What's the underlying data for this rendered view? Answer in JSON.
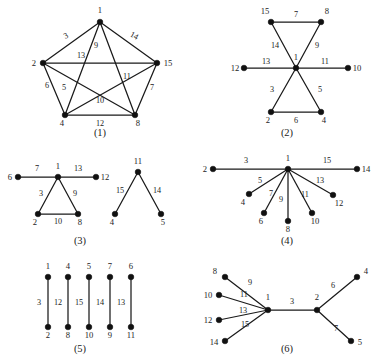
{
  "figure": {
    "background_color": "#ffffff",
    "ink_color": "#1a1a1a",
    "width": 379,
    "height": 363
  },
  "chart_data": {
    "type": "diagram",
    "title": "",
    "subtitle": "",
    "xlabel": "",
    "ylabel": "",
    "panel_count": 6,
    "panels": [
      {
        "caption": "(1)",
        "caption_x": 100,
        "caption_y": 136,
        "vertex_count": 5,
        "edge_count": 10,
        "vertices": [
          {
            "id": "1",
            "x": 100,
            "y": 22,
            "lx": 100,
            "ly": 13,
            "anchor": "middle"
          },
          {
            "id": "2",
            "x": 43,
            "y": 63,
            "lx": 34,
            "ly": 66,
            "anchor": "middle"
          },
          {
            "id": "15",
            "x": 157,
            "y": 63,
            "lx": 168,
            "ly": 66,
            "anchor": "middle"
          },
          {
            "id": "4",
            "x": 65,
            "y": 115,
            "lx": 62,
            "ly": 126,
            "anchor": "middle"
          },
          {
            "id": "8",
            "x": 135,
            "y": 115,
            "lx": 138,
            "ly": 126,
            "anchor": "middle"
          }
        ],
        "edges": [
          {
            "label": "3",
            "from": "1",
            "to": "2",
            "lx": 67,
            "ly": 38,
            "rot": -28
          },
          {
            "label": "14",
            "from": "1",
            "to": "15",
            "lx": 133,
            "ly": 38,
            "rot": 28
          },
          {
            "label": "13",
            "from": "2",
            "to": "15",
            "lx": 81,
            "ly": 58,
            "rot": 0
          },
          {
            "label": "9",
            "from": "1",
            "to": "4",
            "lx": 96,
            "ly": 48,
            "rot": 0
          },
          {
            "label": "11",
            "from": "1",
            "to": "8",
            "lx": 127,
            "ly": 79,
            "rot": 0
          },
          {
            "label": "6",
            "from": "2",
            "to": "4",
            "lx": 47,
            "ly": 88,
            "rot": 0
          },
          {
            "label": "5",
            "from": "2",
            "to": "8",
            "lx": 64,
            "ly": 90,
            "rot": 0
          },
          {
            "label": "10",
            "from": "4",
            "to": "15",
            "lx": 100,
            "ly": 103,
            "rot": 0
          },
          {
            "label": "7",
            "from": "15",
            "to": "8",
            "lx": 152,
            "ly": 90,
            "rot": 0
          },
          {
            "label": "12",
            "from": "4",
            "to": "8",
            "lx": 100,
            "ly": 126,
            "rot": 0
          }
        ]
      },
      {
        "caption": "(2)",
        "caption_x": 287,
        "caption_y": 136,
        "vertex_count": 7,
        "edge_count": 6,
        "vertices": [
          {
            "id": "15",
            "x": 271,
            "y": 22,
            "lx": 265,
            "ly": 14,
            "anchor": "middle"
          },
          {
            "id": "8",
            "x": 321,
            "y": 22,
            "lx": 327,
            "ly": 14,
            "anchor": "middle"
          },
          {
            "id": "1",
            "x": 296,
            "y": 68,
            "lx": 296,
            "ly": 60,
            "anchor": "middle"
          },
          {
            "id": "12",
            "x": 244,
            "y": 68,
            "lx": 235,
            "ly": 71,
            "anchor": "middle"
          },
          {
            "id": "10",
            "x": 348,
            "y": 68,
            "lx": 357,
            "ly": 71,
            "anchor": "middle"
          },
          {
            "id": "2",
            "x": 271,
            "y": 112,
            "lx": 268,
            "ly": 123,
            "anchor": "middle"
          },
          {
            "id": "4",
            "x": 321,
            "y": 112,
            "lx": 324,
            "ly": 123,
            "anchor": "middle"
          }
        ],
        "edges": [
          {
            "label": "7",
            "from": "15",
            "to": "8",
            "lx": 296,
            "ly": 17,
            "rot": 0
          },
          {
            "label": "14",
            "from": "15",
            "to": "1",
            "lx": 275,
            "ly": 48,
            "rot": 0
          },
          {
            "label": "9",
            "from": "8",
            "to": "1",
            "lx": 317,
            "ly": 48,
            "rot": 0
          },
          {
            "label": "13",
            "from": "12",
            "to": "1",
            "lx": 266,
            "ly": 64,
            "rot": 0
          },
          {
            "label": "11",
            "from": "1",
            "to": "10",
            "lx": 325,
            "ly": 64,
            "rot": 0
          },
          {
            "label": "3",
            "from": "1",
            "to": "2",
            "lx": 272,
            "ly": 92,
            "rot": 0
          },
          {
            "label": "5",
            "from": "1",
            "to": "4",
            "lx": 320,
            "ly": 92,
            "rot": 0
          },
          {
            "label": "6",
            "from": "2",
            "to": "4",
            "lx": 296,
            "ly": 123,
            "rot": 0
          }
        ]
      },
      {
        "caption": "(3)",
        "caption_x": 80,
        "caption_y": 244,
        "vertex_count": 9,
        "edge_count": 7,
        "vertices": [
          {
            "id": "6",
            "x": 18,
            "y": 177,
            "lx": 10,
            "ly": 180,
            "anchor": "middle"
          },
          {
            "id": "1",
            "x": 58,
            "y": 177,
            "lx": 58,
            "ly": 169,
            "anchor": "middle"
          },
          {
            "id": "12",
            "x": 96,
            "y": 177,
            "lx": 105,
            "ly": 180,
            "anchor": "middle"
          },
          {
            "id": "2",
            "x": 38,
            "y": 214,
            "lx": 35,
            "ly": 225,
            "anchor": "middle"
          },
          {
            "id": "8",
            "x": 78,
            "y": 214,
            "lx": 80,
            "ly": 225,
            "anchor": "middle"
          },
          {
            "id": "11",
            "x": 138,
            "y": 172,
            "lx": 138,
            "ly": 164,
            "anchor": "middle"
          },
          {
            "id": "4",
            "x": 115,
            "y": 214,
            "lx": 112,
            "ly": 225,
            "anchor": "middle"
          },
          {
            "id": "5",
            "x": 161,
            "y": 214,
            "lx": 163,
            "ly": 225,
            "anchor": "middle"
          }
        ],
        "edges": [
          {
            "label": "7",
            "from": "6",
            "to": "1",
            "lx": 37,
            "ly": 171,
            "rot": 0
          },
          {
            "label": "13",
            "from": "1",
            "to": "12",
            "lx": 78,
            "ly": 171,
            "rot": 0
          },
          {
            "label": "3",
            "from": "1",
            "to": "2",
            "lx": 41,
            "ly": 196,
            "rot": 0
          },
          {
            "label": "9",
            "from": "1",
            "to": "8",
            "lx": 75,
            "ly": 196,
            "rot": 0
          },
          {
            "label": "10",
            "from": "2",
            "to": "8",
            "lx": 58,
            "ly": 224,
            "rot": 0
          },
          {
            "label": "15",
            "from": "11",
            "to": "4",
            "lx": 120,
            "ly": 193,
            "rot": 0
          },
          {
            "label": "14",
            "from": "11",
            "to": "5",
            "lx": 157,
            "ly": 193,
            "rot": 0
          }
        ]
      },
      {
        "caption": "(4)",
        "caption_x": 287,
        "caption_y": 244,
        "vertex_count": 9,
        "edge_count": 8,
        "vertices": [
          {
            "id": "1",
            "x": 288,
            "y": 169,
            "lx": 288,
            "ly": 161,
            "anchor": "middle"
          },
          {
            "id": "2",
            "x": 213,
            "y": 169,
            "lx": 205,
            "ly": 172,
            "anchor": "middle"
          },
          {
            "id": "14",
            "x": 357,
            "y": 169,
            "lx": 366,
            "ly": 172,
            "anchor": "middle"
          },
          {
            "id": "4",
            "x": 249,
            "y": 194,
            "lx": 243,
            "ly": 205,
            "anchor": "middle"
          },
          {
            "id": "6",
            "x": 264,
            "y": 213,
            "lx": 261,
            "ly": 224,
            "anchor": "middle"
          },
          {
            "id": "8",
            "x": 288,
            "y": 221,
            "lx": 288,
            "ly": 232,
            "anchor": "middle"
          },
          {
            "id": "10",
            "x": 312,
            "y": 213,
            "lx": 315,
            "ly": 224,
            "anchor": "middle"
          },
          {
            "id": "12",
            "x": 333,
            "y": 195,
            "lx": 339,
            "ly": 206,
            "anchor": "middle"
          }
        ],
        "edges": [
          {
            "label": "3",
            "from": "2",
            "to": "1",
            "lx": 246,
            "ly": 163,
            "rot": 0
          },
          {
            "label": "15",
            "from": "1",
            "to": "14",
            "lx": 327,
            "ly": 163,
            "rot": 0
          },
          {
            "label": "5",
            "from": "1",
            "to": "4",
            "lx": 260,
            "ly": 183,
            "rot": 0
          },
          {
            "label": "7",
            "from": "1",
            "to": "6",
            "lx": 271,
            "ly": 196,
            "rot": 0
          },
          {
            "label": "9",
            "from": "1",
            "to": "8",
            "lx": 281,
            "ly": 202,
            "rot": 0
          },
          {
            "label": "11",
            "from": "1",
            "to": "10",
            "lx": 305,
            "ly": 197,
            "rot": 0
          },
          {
            "label": "13",
            "from": "1",
            "to": "12",
            "lx": 320,
            "ly": 183,
            "rot": 0
          }
        ]
      },
      {
        "caption": "(5)",
        "caption_x": 80,
        "caption_y": 352,
        "vertex_count": 10,
        "edge_count": 5,
        "vertices": [
          {
            "id": "1",
            "x": 48,
            "y": 277,
            "lx": 48,
            "ly": 269,
            "anchor": "middle"
          },
          {
            "id": "4",
            "x": 68,
            "y": 277,
            "lx": 68,
            "ly": 269,
            "anchor": "middle"
          },
          {
            "id": "5",
            "x": 89,
            "y": 277,
            "lx": 89,
            "ly": 269,
            "anchor": "middle"
          },
          {
            "id": "7",
            "x": 110,
            "y": 277,
            "lx": 110,
            "ly": 269,
            "anchor": "middle"
          },
          {
            "id": "6",
            "x": 131,
            "y": 277,
            "lx": 131,
            "ly": 269,
            "anchor": "middle"
          },
          {
            "id": "2",
            "x": 48,
            "y": 327,
            "lx": 48,
            "ly": 338,
            "anchor": "middle"
          },
          {
            "id": "8",
            "x": 68,
            "y": 327,
            "lx": 68,
            "ly": 338,
            "anchor": "middle"
          },
          {
            "id": "10",
            "x": 89,
            "y": 327,
            "lx": 89,
            "ly": 338,
            "anchor": "middle"
          },
          {
            "id": "9",
            "x": 110,
            "y": 327,
            "lx": 110,
            "ly": 338,
            "anchor": "middle"
          },
          {
            "id": "11",
            "x": 131,
            "y": 327,
            "lx": 131,
            "ly": 338,
            "anchor": "middle"
          }
        ],
        "edges": [
          {
            "label": "3",
            "from": "1",
            "to": "2",
            "lx": 39,
            "ly": 305,
            "rot": 0
          },
          {
            "label": "12",
            "from": "4",
            "to": "8",
            "lx": 58,
            "ly": 305,
            "rot": 0
          },
          {
            "label": "15",
            "from": "5",
            "to": "10",
            "lx": 79,
            "ly": 305,
            "rot": 0
          },
          {
            "label": "14",
            "from": "7",
            "to": "9",
            "lx": 100,
            "ly": 305,
            "rot": 0
          },
          {
            "label": "13",
            "from": "6",
            "to": "11",
            "lx": 121,
            "ly": 305,
            "rot": 0
          }
        ]
      },
      {
        "caption": "(6)",
        "caption_x": 287,
        "caption_y": 352,
        "vertex_count": 9,
        "edge_count": 7,
        "vertices": [
          {
            "id": "1",
            "x": 268,
            "y": 310,
            "lx": 268,
            "ly": 300,
            "anchor": "middle"
          },
          {
            "id": "2",
            "x": 317,
            "y": 310,
            "lx": 317,
            "ly": 300,
            "anchor": "middle"
          },
          {
            "id": "8",
            "x": 225,
            "y": 277,
            "lx": 215,
            "ly": 274,
            "anchor": "middle"
          },
          {
            "id": "10",
            "x": 219,
            "y": 295,
            "lx": 208,
            "ly": 298,
            "anchor": "middle"
          },
          {
            "id": "12",
            "x": 219,
            "y": 320,
            "lx": 208,
            "ly": 323,
            "anchor": "middle"
          },
          {
            "id": "14",
            "x": 225,
            "y": 341,
            "lx": 214,
            "ly": 345,
            "anchor": "middle"
          },
          {
            "id": "4",
            "x": 357,
            "y": 277,
            "lx": 366,
            "ly": 274,
            "anchor": "middle"
          },
          {
            "id": "5",
            "x": 351,
            "y": 341,
            "lx": 360,
            "ly": 345,
            "anchor": "middle"
          }
        ],
        "edges": [
          {
            "label": "9",
            "from": "8",
            "to": "1",
            "lx": 250,
            "ly": 285,
            "rot": 0
          },
          {
            "label": "11",
            "from": "10",
            "to": "1",
            "lx": 244,
            "ly": 297,
            "rot": 0
          },
          {
            "label": "13",
            "from": "12",
            "to": "1",
            "lx": 243,
            "ly": 313,
            "rot": 0
          },
          {
            "label": "15",
            "from": "14",
            "to": "1",
            "lx": 245,
            "ly": 327,
            "rot": 0
          },
          {
            "label": "3",
            "from": "1",
            "to": "2",
            "lx": 292,
            "ly": 304,
            "rot": 0
          },
          {
            "label": "6",
            "from": "2",
            "to": "4",
            "lx": 333,
            "ly": 288,
            "rot": 0
          },
          {
            "label": "7",
            "from": "2",
            "to": "5",
            "lx": 336,
            "ly": 331,
            "rot": 0
          }
        ]
      }
    ]
  }
}
